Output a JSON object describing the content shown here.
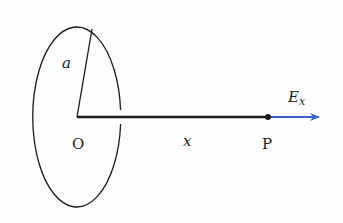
{
  "diagram": {
    "title": "",
    "labels": {
      "radius": "a",
      "origin": "O",
      "distance": "x",
      "point": "P",
      "field_main": "E",
      "field_sub": "x"
    },
    "colors": {
      "background": "#fdfdfd",
      "stroke": "#1a1a1a",
      "arrow": "#3a63c4"
    },
    "elements": [
      {
        "type": "ring",
        "shape": "ellipse",
        "description": "charged ring seen in perspective"
      },
      {
        "type": "radius-line",
        "label": "a"
      },
      {
        "type": "axis-line",
        "from": "O",
        "to": "P",
        "label": "x"
      },
      {
        "type": "point",
        "label": "P"
      },
      {
        "type": "vector",
        "label": "E_x",
        "direction": "+x"
      }
    ]
  }
}
